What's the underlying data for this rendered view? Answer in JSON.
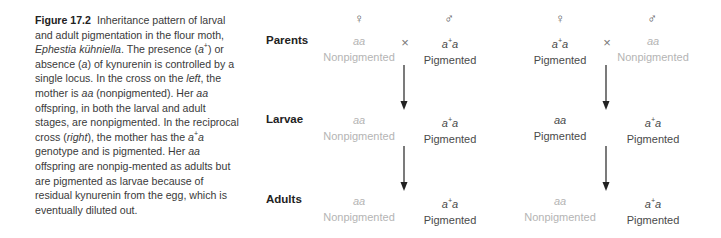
{
  "caption": {
    "figure_label": "Figure 17.2",
    "segments": [
      {
        "t": "Inheritance pattern of larval and adult pigmentation in the flour moth, "
      },
      {
        "t": "Ephestia kühniella",
        "i": true
      },
      {
        "t": ". The presence ("
      },
      {
        "t": "a",
        "i": true
      },
      {
        "t": "+",
        "sup": true
      },
      {
        "t": ") or absence ("
      },
      {
        "t": "a",
        "i": true
      },
      {
        "t": ") of kynurenin is controlled by a single locus. In the cross on the "
      },
      {
        "t": "left",
        "i": true
      },
      {
        "t": ", the mother is "
      },
      {
        "t": "aa",
        "i": true
      },
      {
        "t": " (nonpigmented). Her "
      },
      {
        "t": "aa",
        "i": true
      },
      {
        "t": " offspring, in both the larval and adult stages, are nonpigmented. In the reciprocal cross ("
      },
      {
        "t": "right",
        "i": true
      },
      {
        "t": "), the mother has the "
      },
      {
        "t": "a",
        "i": true
      },
      {
        "t": "+",
        "sup": true
      },
      {
        "t": "a",
        "i": true
      },
      {
        "t": " genotype and is pigmented. Her "
      },
      {
        "t": "aa",
        "i": true
      },
      {
        "t": " offspring are nonpig-mented as adults but are pigmented as larvae because of residual kynurenin from the egg, which is eventually diluted out."
      }
    ]
  },
  "diagram": {
    "row_labels": {
      "parents": "Parents",
      "larvae": "Larvae",
      "adults": "Adults"
    },
    "sex_symbols": {
      "female": "♀",
      "male": "♂"
    },
    "cross_symbol": "×",
    "left_cross": {
      "parents": {
        "female": {
          "genotype_base": "aa",
          "genotype_sup": "",
          "genotype_tail": "",
          "phenotype": "Nonpigmented",
          "tone": "light"
        },
        "male": {
          "genotype_base": "a",
          "genotype_sup": "+",
          "genotype_tail": "a",
          "phenotype": "Pigmented",
          "tone": "dark"
        }
      },
      "larvae": {
        "aa": {
          "genotype_base": "aa",
          "genotype_sup": "",
          "genotype_tail": "",
          "phenotype": "Nonpigmented",
          "tone": "light"
        },
        "a_plus_a": {
          "genotype_base": "a",
          "genotype_sup": "+",
          "genotype_tail": "a",
          "phenotype": "Pigmented",
          "tone": "dark"
        }
      },
      "adults": {
        "aa": {
          "genotype_base": "aa",
          "genotype_sup": "",
          "genotype_tail": "",
          "phenotype": "Nonpigmented",
          "tone": "light"
        },
        "a_plus_a": {
          "genotype_base": "a",
          "genotype_sup": "+",
          "genotype_tail": "a",
          "phenotype": "Pigmented",
          "tone": "dark"
        }
      }
    },
    "right_cross": {
      "parents": {
        "female": {
          "genotype_base": "a",
          "genotype_sup": "+",
          "genotype_tail": "a",
          "phenotype": "Pigmented",
          "tone": "dark"
        },
        "male": {
          "genotype_base": "aa",
          "genotype_sup": "",
          "genotype_tail": "",
          "phenotype": "Nonpigmented",
          "tone": "light"
        }
      },
      "larvae": {
        "aa": {
          "genotype_base": "aa",
          "genotype_sup": "",
          "genotype_tail": "",
          "phenotype": "Pigmented",
          "tone": "dark"
        },
        "a_plus_a": {
          "genotype_base": "a",
          "genotype_sup": "+",
          "genotype_tail": "a",
          "phenotype": "Pigmented",
          "tone": "dark"
        }
      },
      "adults": {
        "aa": {
          "genotype_base": "aa",
          "genotype_sup": "",
          "genotype_tail": "",
          "phenotype": "Nonpigmented",
          "tone": "light"
        },
        "a_plus_a": {
          "genotype_base": "a",
          "genotype_sup": "+",
          "genotype_tail": "a",
          "phenotype": "Pigmented",
          "tone": "dark"
        }
      }
    },
    "colors": {
      "light": "#b4b4b4",
      "dark": "#4a4a4a",
      "arrow": "#222222"
    }
  }
}
